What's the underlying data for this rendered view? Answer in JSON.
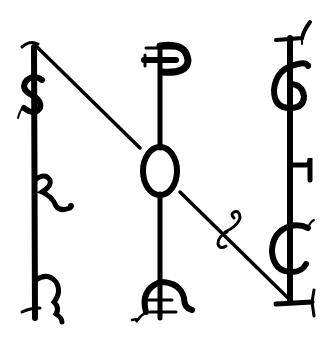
{
  "figure": {
    "title": "",
    "background_color": "#ffffff",
    "ink_color": "#000000"
  },
  "staffs": [
    {
      "name": "left",
      "glyphs": [
        {
          "id": "s",
          "char": "S"
        },
        {
          "id": "r",
          "char": "R"
        },
        {
          "id": "h",
          "char": "h"
        }
      ]
    },
    {
      "name": "middle",
      "glyphs": [
        {
          "id": "p",
          "char": "P"
        },
        {
          "id": "o",
          "char": "O"
        },
        {
          "id": "a",
          "char": "A"
        }
      ]
    },
    {
      "name": "right",
      "glyphs": [
        {
          "id": "g",
          "char": "G"
        },
        {
          "id": "f",
          "char": "F"
        },
        {
          "id": "c",
          "char": "C"
        },
        {
          "id": "l",
          "char": "L"
        }
      ]
    }
  ],
  "ornaments": [
    {
      "id": "diagonal-curl",
      "symbol": "&"
    }
  ]
}
